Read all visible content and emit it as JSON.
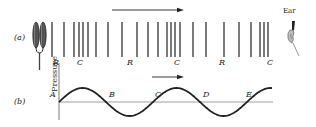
{
  "figure": {
    "part_a": {
      "label": "(a)",
      "source_icon": "tuning-fork-icon",
      "receiver_icon": "ear-icon",
      "receiver_label": "Ear",
      "direction_arrow": "right",
      "region_labels": [
        {
          "text": "R",
          "x": 56
        },
        {
          "text": "C",
          "x": 80
        },
        {
          "text": "R",
          "x": 130
        },
        {
          "text": "C",
          "x": 177
        },
        {
          "text": "R",
          "x": 222
        },
        {
          "text": "C",
          "x": 270
        }
      ],
      "line_positions": [
        52,
        64,
        74,
        79,
        83,
        88,
        96,
        108,
        122,
        137,
        148,
        158,
        167,
        171,
        175,
        180,
        193,
        206,
        224,
        239,
        251,
        260,
        264,
        268
      ]
    },
    "part_b": {
      "label": "(b)",
      "y_axis_label": "Pressure",
      "direction_arrow": "right",
      "points": [
        {
          "text": "A",
          "x": 59
        },
        {
          "text": "B",
          "x": 107
        },
        {
          "text": "C",
          "x": 153
        },
        {
          "text": "D",
          "x": 201
        },
        {
          "text": "E",
          "x": 244
        }
      ],
      "wave": {
        "type": "sine",
        "start_x": 59,
        "end_x": 272,
        "baseline_y": 102,
        "amplitude": 14,
        "period": 94
      }
    }
  }
}
